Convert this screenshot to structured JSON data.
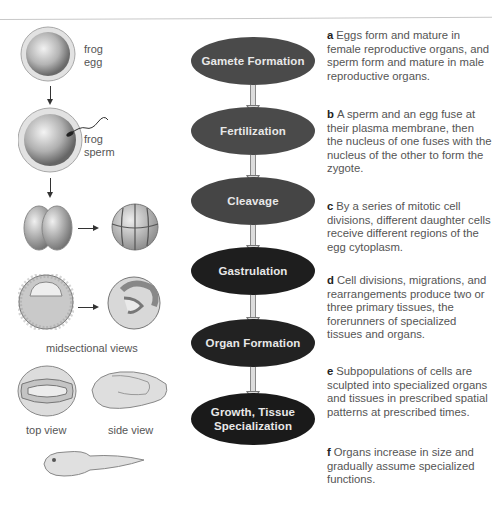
{
  "colors": {
    "stage_fills": [
      "#4a4a4a",
      "#4a4a4a",
      "#454545",
      "#1e1e1e",
      "#222222",
      "#1a1a1a"
    ],
    "stage_text": "#e8e8e8",
    "arrow_fill": "#dcdcdc",
    "description_text": "#555555"
  },
  "stages": [
    {
      "letter": "a",
      "label": "Gamete Formation",
      "description": "Eggs form and mature in female reproductive organs, and sperm form and mature in male reproductive organs."
    },
    {
      "letter": "b",
      "label": "Fertilization",
      "description": "A sperm and an egg fuse at their plasma membrane, then the nucleus of one fuses with the nucleus of the other to form the zygote."
    },
    {
      "letter": "c",
      "label": "Cleavage",
      "description": "By a series of mitotic cell divisions, different daughter cells receive different regions of the egg cytoplasm."
    },
    {
      "letter": "d",
      "label": "Gastrulation",
      "description": "Cell divisions, migrations, and rearrangements produce two or three primary tissues, the forerunners of specialized tissues and organs."
    },
    {
      "letter": "e",
      "label": "Organ Formation",
      "description": "Subpopulations of cells are sculpted into specialized organs and tissues in prescribed spatial patterns at prescribed times."
    },
    {
      "letter": "f",
      "label_line1": "Growth, Tissue",
      "label_line2": "Specialization",
      "description": "Organs increase in size and gradually assume specialized functions."
    }
  ],
  "illustrations": {
    "egg_label_1": "frog",
    "egg_label_2": "egg",
    "sperm_label_1": "frog",
    "sperm_label_2": "sperm",
    "midsection_caption": "midsectional views",
    "top_view_caption": "top view",
    "side_view_caption": "side view"
  }
}
